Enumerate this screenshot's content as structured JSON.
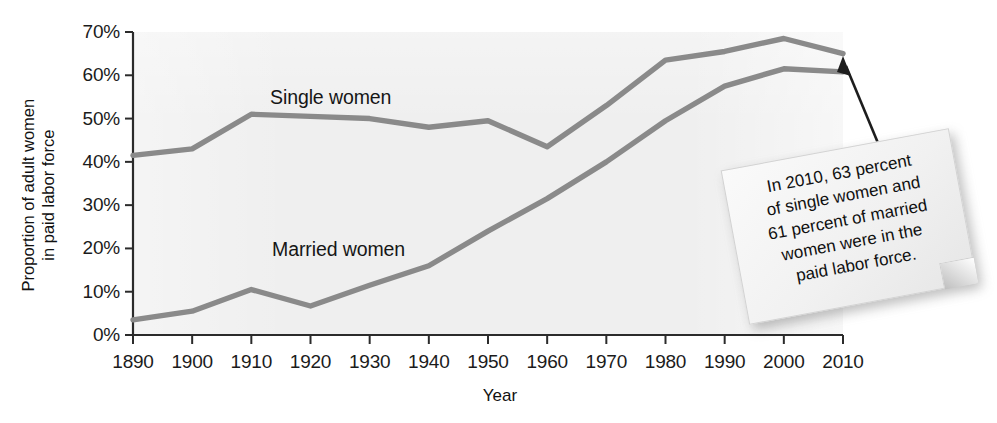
{
  "chart_data": {
    "type": "line",
    "title": "",
    "xlabel": "Year",
    "ylabel": "Proportion of adult women in paid labor force",
    "ylabel_lines": [
      "Proportion of adult women",
      "in paid labor force"
    ],
    "x": [
      1890,
      1900,
      1910,
      1920,
      1930,
      1940,
      1950,
      1960,
      1970,
      1980,
      1990,
      2000,
      2010
    ],
    "xlim": [
      1890,
      2010
    ],
    "ylim": [
      0,
      70
    ],
    "grid": false,
    "legend_position": "inline-labels",
    "xticks": [
      "1890",
      "1900",
      "1910",
      "1920",
      "1930",
      "1940",
      "1950",
      "1960",
      "1970",
      "1980",
      "1990",
      "2000",
      "2010"
    ],
    "yticks": [
      "0%",
      "10%",
      "20%",
      "30%",
      "40%",
      "50%",
      "60%",
      "70%"
    ],
    "ytick_values": [
      0,
      10,
      20,
      30,
      40,
      50,
      60,
      70
    ],
    "series": [
      {
        "name": "Single women",
        "color": "#8a8a8a",
        "values": [
          41.5,
          43.0,
          51.0,
          50.5,
          50.0,
          48.0,
          49.5,
          43.5,
          53.0,
          63.5,
          65.5,
          68.5,
          65.0
        ]
      },
      {
        "name": "Married women",
        "color": "#8a8a8a",
        "values": [
          3.5,
          5.5,
          10.5,
          6.7,
          11.5,
          16.0,
          24.0,
          31.5,
          40.0,
          49.5,
          57.5,
          61.5,
          60.8
        ]
      }
    ],
    "annotations": [
      {
        "name": "callout-2010",
        "lines": [
          "In 2010, 63 percent",
          "of single women and",
          "61 percent of married",
          "women were in the",
          "paid labor force."
        ],
        "points_to": "2010 end of lines"
      }
    ]
  },
  "axis": {
    "y_label_line1": "Proportion of adult women",
    "y_label_line2": "in paid labor force",
    "x_label": "Year"
  },
  "series_labels": {
    "single": "Single women",
    "married": "Married women"
  },
  "callout": {
    "line1": "In 2010, 63 percent",
    "line2": "of single women and",
    "line3": "61 percent of married",
    "line4": "women were in the",
    "line5": "paid labor force."
  },
  "colors": {
    "line": "#8a8a8a",
    "axis": "#2b2b2b",
    "text": "#111111",
    "plot_background": "#efefef",
    "note_background": "#f2f2f2"
  }
}
